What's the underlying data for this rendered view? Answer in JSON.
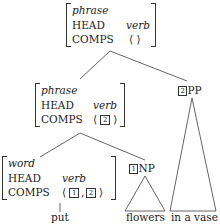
{
  "nodes": {
    "top": {
      "type": "phrase",
      "head_feat": "HEAD",
      "head_val": "verb",
      "comps_feat": "COMPS",
      "comps_val": "⟨ ⟩"
    },
    "mid": {
      "type": "phrase",
      "head_feat": "HEAD",
      "head_val": "verb",
      "comps_feat": "COMPS",
      "comps_open": "⟨",
      "comps_tag": "2",
      "comps_close": "⟩"
    },
    "word": {
      "type": "word",
      "head_feat": "HEAD",
      "head_val": "verb",
      "comps_feat": "COMPS",
      "comps_open": "⟨",
      "comps_tag1": "1",
      "comps_sep": ",",
      "comps_tag2": "2",
      "comps_close": "⟩"
    },
    "np": {
      "tag": "1",
      "category": "NP"
    },
    "pp": {
      "tag": "2",
      "category": "PP"
    }
  },
  "leaves": {
    "put": "put",
    "flowers": "flowers",
    "vase": "in a vase"
  }
}
